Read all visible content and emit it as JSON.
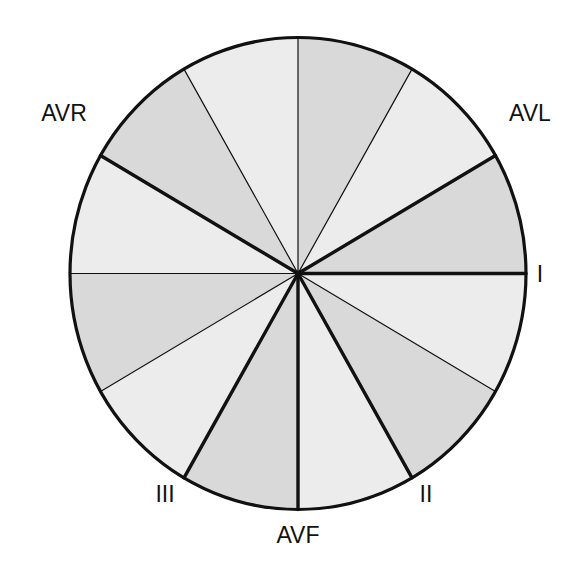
{
  "diagram": {
    "center": [
      298,
      273.5
    ],
    "radius_x": 228,
    "radius_y": 236,
    "colors": {
      "sector_dark": "#d9d9d9",
      "sector_light": "#ececec",
      "stroke": "#111111",
      "background": "#ffffff"
    },
    "sectors": [
      {
        "from_deg": 0,
        "to_deg": 30,
        "shade": "dark"
      },
      {
        "from_deg": 30,
        "to_deg": 60,
        "shade": "light"
      },
      {
        "from_deg": 60,
        "to_deg": 90,
        "shade": "dark"
      },
      {
        "from_deg": 90,
        "to_deg": 120,
        "shade": "light"
      },
      {
        "from_deg": 120,
        "to_deg": 150,
        "shade": "dark"
      },
      {
        "from_deg": 150,
        "to_deg": 180,
        "shade": "light"
      },
      {
        "from_deg": 180,
        "to_deg": 210,
        "shade": "dark"
      },
      {
        "from_deg": 210,
        "to_deg": 240,
        "shade": "light"
      },
      {
        "from_deg": 240,
        "to_deg": 270,
        "shade": "dark"
      },
      {
        "from_deg": 270,
        "to_deg": 300,
        "shade": "light"
      },
      {
        "from_deg": 300,
        "to_deg": 330,
        "shade": "dark"
      },
      {
        "from_deg": 330,
        "to_deg": 360,
        "shade": "light"
      }
    ],
    "spokes": [
      {
        "deg": 0,
        "weight": "thick",
        "lead": "I"
      },
      {
        "deg": 30,
        "weight": "thick",
        "lead": "AVL"
      },
      {
        "deg": 60,
        "weight": "thin"
      },
      {
        "deg": 90,
        "weight": "thin"
      },
      {
        "deg": 120,
        "weight": "thin"
      },
      {
        "deg": 150,
        "weight": "thick",
        "lead": "AVR"
      },
      {
        "deg": 180,
        "weight": "thin"
      },
      {
        "deg": 210,
        "weight": "thin"
      },
      {
        "deg": 240,
        "weight": "thick",
        "lead": "III"
      },
      {
        "deg": 270,
        "weight": "thick",
        "lead": "AVF"
      },
      {
        "deg": 300,
        "weight": "thick",
        "lead": "II"
      },
      {
        "deg": 330,
        "weight": "thin"
      }
    ],
    "labels": {
      "avr": {
        "text": "AVR",
        "x": 64,
        "y": 121
      },
      "avl": {
        "text": "AVL",
        "x": 530,
        "y": 121
      },
      "i": {
        "text": "I",
        "x": 540,
        "y": 282
      },
      "iii": {
        "text": "III",
        "x": 165,
        "y": 502
      },
      "ii": {
        "text": "II",
        "x": 426,
        "y": 502
      },
      "avf": {
        "text": "AVF",
        "x": 298,
        "y": 543
      }
    }
  }
}
